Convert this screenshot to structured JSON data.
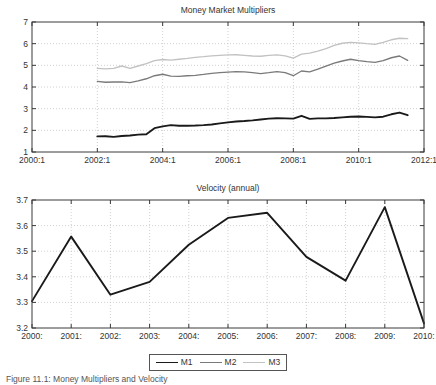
{
  "figure": {
    "caption": "Figure 11.1: Money Multipliers and Velocity"
  },
  "legend": {
    "items": [
      {
        "label": "M1",
        "color": "#1a1a1a",
        "width": 1.9
      },
      {
        "label": "M2",
        "color": "#7a7a7a",
        "width": 1.4
      },
      {
        "label": "M3",
        "color": "#c2c2c2",
        "width": 1.4
      }
    ]
  },
  "chart_data": [
    {
      "type": "line",
      "title": "Money Market Multipliers",
      "xlabel": "",
      "ylabel": "",
      "grid": true,
      "legend_position": "below-figure",
      "xlim": [
        2000.0,
        2012.0
      ],
      "ylim": [
        1,
        7
      ],
      "yticks": [
        1,
        2,
        3,
        4,
        5,
        6,
        7
      ],
      "xticks": [
        2000.0,
        2002.0,
        2004.0,
        2006.0,
        2008.0,
        2010.0,
        2012.0
      ],
      "xticklabels": [
        "2000:1",
        "2002:1",
        "2004:1",
        "2006:1",
        "2008:1",
        "2010:1",
        "2012:1"
      ],
      "series": [
        {
          "name": "M1",
          "color": "#1a1a1a",
          "x": [
            2002.0,
            2002.25,
            2002.5,
            2002.75,
            2003.0,
            2003.25,
            2003.5,
            2003.75,
            2004.0,
            2004.25,
            2004.5,
            2004.75,
            2005.0,
            2005.25,
            2005.5,
            2005.75,
            2006.0,
            2006.25,
            2006.5,
            2006.75,
            2007.0,
            2007.25,
            2007.5,
            2007.75,
            2008.0,
            2008.25,
            2008.5,
            2008.75,
            2009.0,
            2009.25,
            2009.5,
            2009.75,
            2010.0,
            2010.25,
            2010.5,
            2010.75,
            2011.0,
            2011.25,
            2011.5
          ],
          "values": [
            1.72,
            1.73,
            1.7,
            1.74,
            1.76,
            1.8,
            1.82,
            2.1,
            2.18,
            2.24,
            2.21,
            2.21,
            2.22,
            2.24,
            2.27,
            2.32,
            2.37,
            2.41,
            2.43,
            2.46,
            2.5,
            2.54,
            2.56,
            2.55,
            2.54,
            2.67,
            2.53,
            2.55,
            2.55,
            2.57,
            2.6,
            2.63,
            2.64,
            2.62,
            2.6,
            2.63,
            2.74,
            2.82,
            2.7
          ]
        },
        {
          "name": "M2",
          "color": "#7a7a7a",
          "x": [
            2002.0,
            2002.25,
            2002.5,
            2002.75,
            2003.0,
            2003.25,
            2003.5,
            2003.75,
            2004.0,
            2004.25,
            2004.5,
            2004.75,
            2005.0,
            2005.25,
            2005.5,
            2005.75,
            2006.0,
            2006.25,
            2006.5,
            2006.75,
            2007.0,
            2007.25,
            2007.5,
            2007.75,
            2008.0,
            2008.25,
            2008.5,
            2008.75,
            2009.0,
            2009.25,
            2009.5,
            2009.75,
            2010.0,
            2010.25,
            2010.5,
            2010.75,
            2011.0,
            2011.25,
            2011.5
          ],
          "values": [
            4.26,
            4.22,
            4.23,
            4.24,
            4.2,
            4.28,
            4.38,
            4.52,
            4.59,
            4.5,
            4.49,
            4.52,
            4.54,
            4.58,
            4.63,
            4.66,
            4.69,
            4.71,
            4.7,
            4.66,
            4.62,
            4.66,
            4.71,
            4.66,
            4.52,
            4.74,
            4.7,
            4.82,
            4.96,
            5.1,
            5.2,
            5.28,
            5.22,
            5.17,
            5.14,
            5.22,
            5.35,
            5.43,
            5.23
          ]
        },
        {
          "name": "M3",
          "color": "#c2c2c2",
          "x": [
            2002.0,
            2002.25,
            2002.5,
            2002.75,
            2003.0,
            2003.25,
            2003.5,
            2003.75,
            2004.0,
            2004.25,
            2004.5,
            2004.75,
            2005.0,
            2005.25,
            2005.5,
            2005.75,
            2006.0,
            2006.25,
            2006.5,
            2006.75,
            2007.0,
            2007.25,
            2007.5,
            2007.75,
            2008.0,
            2008.25,
            2008.5,
            2008.75,
            2009.0,
            2009.25,
            2009.5,
            2009.75,
            2010.0,
            2010.25,
            2010.5,
            2010.75,
            2011.0,
            2011.25,
            2011.5
          ],
          "values": [
            4.86,
            4.84,
            4.86,
            4.97,
            4.86,
            4.97,
            5.08,
            5.22,
            5.27,
            5.24,
            5.28,
            5.32,
            5.37,
            5.4,
            5.44,
            5.46,
            5.48,
            5.49,
            5.46,
            5.43,
            5.42,
            5.46,
            5.48,
            5.44,
            5.33,
            5.52,
            5.56,
            5.66,
            5.77,
            5.92,
            6.02,
            6.06,
            6.04,
            6.0,
            5.97,
            6.06,
            6.18,
            6.25,
            6.23
          ]
        }
      ]
    },
    {
      "type": "line",
      "title": "Velocity (annual)",
      "xlabel": "",
      "ylabel": "",
      "grid": true,
      "xlim": [
        2000,
        2010
      ],
      "ylim": [
        3.2,
        3.7
      ],
      "yticks": [
        3.2,
        3.3,
        3.4,
        3.5,
        3.6,
        3.7
      ],
      "yticklabels": [
        "3.2",
        "3.3",
        "3.4",
        "3.5",
        "3.6",
        "3.7"
      ],
      "xticks": [
        2000,
        2001,
        2002,
        2003,
        2004,
        2005,
        2006,
        2007,
        2008,
        2009,
        2010
      ],
      "xticklabels": [
        "2000:",
        "2001:",
        "2002:",
        "2003:",
        "2004:",
        "2005:",
        "2006:",
        "2007:",
        "2008:",
        "2009:",
        "2010:"
      ],
      "series": [
        {
          "name": "M1",
          "color": "#1a1a1a",
          "x": [
            2000,
            2001,
            2002,
            2003,
            2004,
            2005,
            2006,
            2007,
            2008,
            2009,
            2010
          ],
          "values": [
            3.305,
            3.557,
            3.33,
            3.38,
            3.525,
            3.63,
            3.65,
            3.478,
            3.385,
            3.672,
            3.218
          ]
        }
      ]
    }
  ]
}
